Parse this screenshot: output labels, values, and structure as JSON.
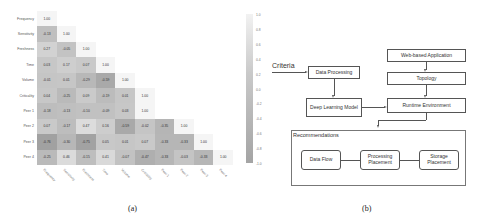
{
  "figure_a": {
    "caption": "(a)",
    "row_labels": [
      "Frequency",
      "Sensitivity",
      "Freshness",
      "Time",
      "Volume",
      "Criticality",
      "Peer 1",
      "Peer 2",
      "Peer 3",
      "Peer 4"
    ],
    "col_labels": [
      "Frequency",
      "Sensitivity",
      "Freshness",
      "Time",
      "Volume",
      "Criticality",
      "Peer 1",
      "Peer 2",
      "Peer 3",
      "Peer 4"
    ],
    "colorbar_ticks": [
      "1.0",
      "0.8",
      "0.6",
      "0.4",
      "0.2",
      "0.0",
      "-0.2",
      "-0.4",
      "-0.6",
      "-0.8",
      "-1.0"
    ]
  },
  "chart_data": {
    "type": "heatmap",
    "title": "",
    "row_labels": [
      "Frequency",
      "Sensitivity",
      "Freshness",
      "Time",
      "Volume",
      "Criticality",
      "Peer 1",
      "Peer 2",
      "Peer 3",
      "Peer 4"
    ],
    "col_labels": [
      "Frequency",
      "Sensitivity",
      "Freshness",
      "Time",
      "Volume",
      "Criticality",
      "Peer 1",
      "Peer 2",
      "Peer 3",
      "Peer 4"
    ],
    "values": [
      [
        1.0
      ],
      [
        -0.13,
        1.0
      ],
      [
        0.27,
        -0.05,
        1.0
      ],
      [
        0.03,
        0.17,
        0.07,
        1.0
      ],
      [
        -0.01,
        0.01,
        -0.29,
        -0.59,
        1.0
      ],
      [
        0.04,
        -0.25,
        0.09,
        -0.19,
        0.01,
        1.0
      ],
      [
        -0.18,
        -0.13,
        -0.1,
        -0.09,
        0.03,
        1.0
      ],
      [
        0.07,
        -0.17,
        0.47,
        0.16,
        -0.59,
        -0.02,
        -0.35,
        1.0
      ],
      [
        -0.76,
        -0.3,
        -0.75,
        0.05,
        0.01,
        0.07,
        -0.33,
        -0.33,
        1.0
      ],
      [
        -0.25,
        0.46,
        -0.15,
        0.41,
        -0.07,
        -0.47,
        -0.33,
        -0.03,
        -0.33,
        1.0
      ]
    ],
    "colorbar": {
      "min": -1.0,
      "max": 1.0
    },
    "layout": "lower-triangular correlation matrix"
  },
  "figure_b": {
    "caption": "(b)",
    "criteria_label": "Criteria",
    "nodes": {
      "data_processing": "Data Processing",
      "deep_learning": "Deep Learning Model",
      "web_app": "Web-based Application",
      "topology": "Topology",
      "runtime": "Runtime Environment",
      "recommendations": "Recommendations",
      "data_flow": "Data Flow",
      "processing_placement": "Processing Placement",
      "storage_placement": "Storage Placement"
    }
  }
}
